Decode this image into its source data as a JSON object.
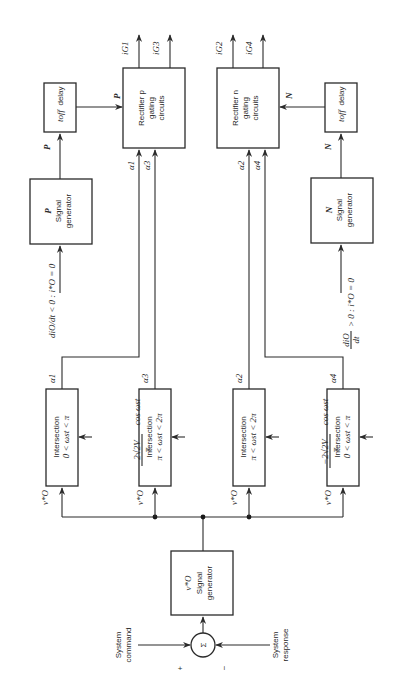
{
  "diagram": {
    "orientation": "rotated-90-ccw",
    "inputs": {
      "system_command_line1": "System",
      "system_command_line2": "command",
      "system_response_line1": "System",
      "system_response_line2": "response",
      "plus_sign": "+",
      "minus_sign": "−",
      "sum_symbol": "Σ"
    },
    "reference_generator": {
      "symbol": "v*O",
      "line1": "Signal",
      "line2": "generator"
    },
    "intersections": [
      {
        "title": "Intersection",
        "range": "0 < ωst < π",
        "input": "v*O",
        "reference": "2√2V cos ωst / π",
        "output": "α1"
      },
      {
        "title": "Intersection",
        "range": "π < ωst < 2π",
        "input": "v*O",
        "reference": "−2√2V cos ωst / π",
        "output": "α3"
      },
      {
        "title": "Intersection",
        "range": "π < ωst < 2π",
        "input": "v*O",
        "reference": "2√2V cos ωst / π",
        "output": "α2"
      },
      {
        "title": "Intersection",
        "range": "0 < ωst < π",
        "input": "v*O",
        "reference": "−2√2V cos ωst / π",
        "output": "α4"
      }
    ],
    "p_generator": {
      "symbol": "P",
      "line1": "Signal",
      "line2": "generator",
      "condition": "diO/dt < 0 : i*O = 0",
      "output": "P"
    },
    "n_generator": {
      "symbol": "N",
      "line1": "Signal",
      "line2": "generator",
      "condition": "diO/dt > 0 : i*O = 0",
      "output": "N"
    },
    "p_delay": {
      "label": "toff delay",
      "output": "P"
    },
    "n_delay": {
      "label": "toff delay",
      "output": "N"
    },
    "rectifier_p": {
      "line1": "Rectifier p",
      "line2": "gating",
      "line3": "circuits",
      "inputs": [
        "α1",
        "α3"
      ],
      "outputs": [
        "iG1",
        "iG3"
      ]
    },
    "rectifier_n": {
      "line1": "Rectifier n",
      "line2": "gating",
      "line3": "circuits",
      "inputs": [
        "α2",
        "α4"
      ],
      "outputs": [
        "iG2",
        "iG4"
      ]
    },
    "labels": {
      "a1": "α1",
      "a3": "α3",
      "a2": "α2",
      "a4": "α4",
      "ig1": "iG1",
      "ig3": "iG3",
      "ig2": "iG2",
      "ig4": "iG4",
      "vo": "v*O",
      "p": "P",
      "n": "N",
      "intersection": "Intersection",
      "range_0_pi": "0 < ωst < π",
      "range_pi_2pi": "π < ωst < 2π",
      "ref_pos_num": "2√2V",
      "ref_neg_num": "−2√2V",
      "ref_cos": "cos ωst",
      "ref_den": "π",
      "toff": "toff",
      "delay": "delay",
      "cond_p": "diO/dt < 0 : i*O = 0",
      "cond_n_num": "diO",
      "cond_n_den": "dt",
      "cond_n_rest": "> 0 : i*O = 0",
      "signal": "Signal",
      "generator": "generator",
      "rect_p": "Rectifier p",
      "rect_n": "Rectifier n",
      "gating": "gating",
      "circuits": "circuits"
    }
  }
}
